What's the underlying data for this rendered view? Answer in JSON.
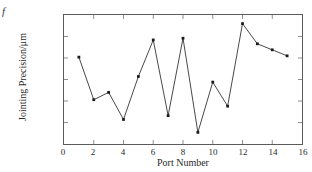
{
  "figure": {
    "stray_glyph": "f",
    "background_color": "#ffffff",
    "axis_color": "#5b5b5b",
    "series_color": "#1a1a1a"
  },
  "chart_data": {
    "type": "line",
    "title": "",
    "xlabel": "Port Number",
    "ylabel": "Jointing Precision/μm",
    "xlim": [
      0,
      16
    ],
    "ylim": [
      10.05,
      10.35
    ],
    "xticks": [
      "0",
      "2",
      "4",
      "6",
      "8",
      "10",
      "12",
      "14",
      "16"
    ],
    "xtick_values": [
      0,
      2,
      4,
      6,
      8,
      10,
      12,
      14,
      16
    ],
    "yticks": [
      "10.05",
      "10.1",
      "10.15",
      "10.2",
      "10.25",
      "10.3",
      "10.35"
    ],
    "ytick_values": [
      10.05,
      10.1,
      10.15,
      10.2,
      10.25,
      10.3,
      10.35
    ],
    "grid": false,
    "legend": false,
    "marker": "square",
    "x": [
      1,
      2,
      3,
      4,
      5,
      6,
      7,
      8,
      9,
      10,
      11,
      12,
      13,
      14,
      15
    ],
    "values": [
      10.252,
      10.153,
      10.17,
      10.107,
      10.207,
      10.292,
      10.116,
      10.296,
      10.077,
      10.194,
      10.138,
      10.33,
      10.283,
      10.269,
      10.255
    ],
    "series": [
      {
        "name": "Jointing Precision",
        "values": [
          10.252,
          10.153,
          10.17,
          10.107,
          10.207,
          10.292,
          10.116,
          10.296,
          10.077,
          10.194,
          10.138,
          10.33,
          10.283,
          10.269,
          10.255
        ]
      }
    ]
  }
}
